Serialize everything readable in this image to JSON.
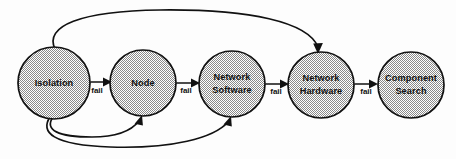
{
  "diagram": {
    "type": "state-flow-diagram",
    "background_color": "#fdfdfd",
    "stroke_color": "#111111",
    "node_fill_pattern": "50-percent-gray-checker-dither",
    "nodes": [
      {
        "id": "isolation",
        "label": "Isolation",
        "label_line1": "Isolation",
        "label_line2": "",
        "cx": 54,
        "cy": 83,
        "r": 36
      },
      {
        "id": "node",
        "label": "Node",
        "label_line1": "Node",
        "label_line2": "",
        "cx": 143,
        "cy": 83,
        "r": 33
      },
      {
        "id": "network-software",
        "label": "Network Software",
        "label_line1": "Network",
        "label_line2": "Software",
        "cx": 232,
        "cy": 84,
        "r": 33
      },
      {
        "id": "network-hardware",
        "label": "Network Hardware",
        "label_line1": "Network",
        "label_line2": "Hardware",
        "cx": 321,
        "cy": 85,
        "r": 33
      },
      {
        "id": "component-search",
        "label": "Component Search",
        "label_line1": "Component",
        "label_line2": "Search",
        "cx": 411,
        "cy": 85,
        "r": 33
      }
    ],
    "edges": [
      {
        "id": "isolation-to-node",
        "from": "isolation",
        "to": "node",
        "label": "fail",
        "kind": "straight"
      },
      {
        "id": "node-to-network-software",
        "from": "node",
        "to": "network-software",
        "label": "fail",
        "kind": "straight"
      },
      {
        "id": "network-software-to-network-hardware",
        "from": "network-software",
        "to": "network-hardware",
        "label": "fail",
        "kind": "straight"
      },
      {
        "id": "network-hardware-to-component-search",
        "from": "network-hardware",
        "to": "component-search",
        "label": "fail",
        "kind": "straight"
      },
      {
        "id": "isolation-to-network-hardware-top",
        "from": "isolation",
        "to": "network-hardware",
        "label": "",
        "kind": "curve-over"
      },
      {
        "id": "isolation-to-node-bottom",
        "from": "isolation",
        "to": "node",
        "label": "",
        "kind": "curve-under"
      },
      {
        "id": "isolation-to-network-software-bottom",
        "from": "isolation",
        "to": "network-software",
        "label": "",
        "kind": "curve-under"
      }
    ],
    "edge_labels": [
      {
        "id": "fail-1",
        "text": "fail",
        "x": 97,
        "y": 91
      },
      {
        "id": "fail-2",
        "text": "fail",
        "x": 186,
        "y": 91
      },
      {
        "id": "fail-3",
        "text": "fail",
        "x": 276,
        "y": 92
      },
      {
        "id": "fail-4",
        "text": "fail",
        "x": 366,
        "y": 92
      }
    ]
  }
}
